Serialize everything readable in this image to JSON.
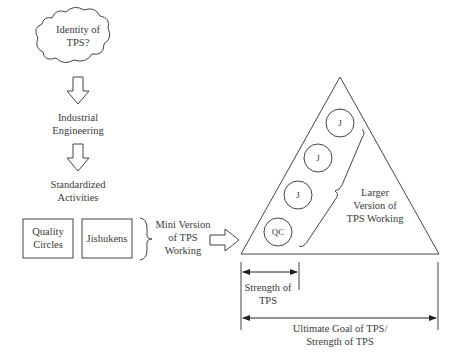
{
  "diagram": {
    "cloud": {
      "label_line1": "Identity of",
      "label_line2": "TPS?"
    },
    "steps": [
      {
        "line1": "Industrial",
        "line2": "Engineering"
      },
      {
        "line1": "Standardized",
        "line2": "Activities"
      }
    ],
    "boxes": [
      {
        "line1": "Quality",
        "line2": "Circles"
      },
      {
        "line1": "Jishukens"
      }
    ],
    "mini_version": {
      "line1": "Mini Version",
      "line2": "of TPS",
      "line3": "Working"
    },
    "triangle": {
      "circles": [
        "J",
        "J",
        "J",
        "QC"
      ],
      "larger_version": {
        "line1": "Larger",
        "line2": "Version of",
        "line3": "TPS Working"
      }
    },
    "strength": {
      "line1": "Strength of",
      "line2": "TPS"
    },
    "ultimate": {
      "line1": "Ultimate Goal of TPS/",
      "line2": "Strength of TPS"
    }
  }
}
